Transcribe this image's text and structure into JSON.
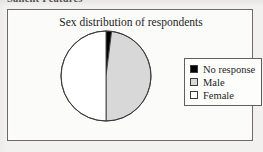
{
  "page": {
    "cutoff_heading": "Salient Features",
    "background_color": "#f2f1ef"
  },
  "figure": {
    "frame_border_color": "#6b6b6b",
    "frame_background": "#fbfbfa"
  },
  "chart_data": {
    "type": "pie",
    "title": "Sex distribution of respondents",
    "categories": [
      "No response",
      "Male",
      "Female"
    ],
    "values": [
      2,
      48,
      50
    ],
    "value_unit": "%",
    "colors": [
      "#000000",
      "#d8d8d8",
      "#ffffff"
    ],
    "slice_border_color": "#3a3a3a",
    "start_angle_deg": 0,
    "direction": "clockwise",
    "legend_position": "right",
    "grid": false,
    "xlabel": "",
    "ylabel": ""
  },
  "legend": {
    "entries": [
      {
        "label": "No response",
        "color": "#000000"
      },
      {
        "label": "Male",
        "color": "#d8d8d8"
      },
      {
        "label": "Female",
        "color": "#ffffff"
      }
    ]
  }
}
